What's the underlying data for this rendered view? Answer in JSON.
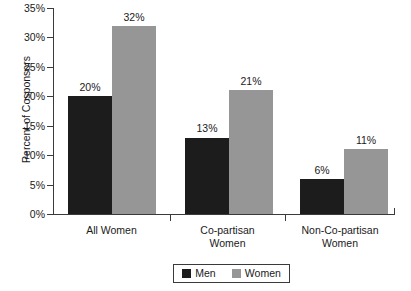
{
  "chart_data": {
    "type": "bar",
    "title": "",
    "xlabel": "",
    "ylabel": "Percent of Cosponsors",
    "ylim": [
      0,
      35
    ],
    "grid": false,
    "legend_position": "bottom",
    "categories": [
      "All Women",
      "Co-partisan Women",
      "Non-Co-partisan Women"
    ],
    "category_lines": [
      [
        "All Women"
      ],
      [
        "Co-partisan",
        "Women"
      ],
      [
        "Non-Co-partisan",
        "Women"
      ]
    ],
    "series": [
      {
        "name": "Men",
        "color": "#1c1c1c",
        "values": [
          20,
          13,
          6
        ],
        "labels": [
          "20%",
          "13%",
          "6%"
        ]
      },
      {
        "name": "Women",
        "color": "#969696",
        "values": [
          32,
          21,
          11
        ],
        "labels": [
          "32%",
          "21%",
          "11%"
        ]
      }
    ],
    "y_ticks": [
      {
        "value": 35,
        "label": "35%"
      },
      {
        "value": 30,
        "label": "30%"
      },
      {
        "value": 25,
        "label": "25%"
      },
      {
        "value": 20,
        "label": "20%"
      },
      {
        "value": 15,
        "label": "15%"
      },
      {
        "value": 10,
        "label": "10%"
      },
      {
        "value": 5,
        "label": "5%"
      },
      {
        "value": 0,
        "label": "0%"
      }
    ]
  },
  "legend": {
    "entries": [
      {
        "label": "Men",
        "color": "#1c1c1c"
      },
      {
        "label": "Women",
        "color": "#969696"
      }
    ]
  }
}
